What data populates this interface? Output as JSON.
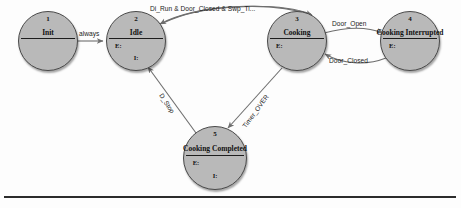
{
  "diagram": {
    "type": "state-transition-diagram",
    "colors": {
      "node_fill": "#b9b9b9",
      "node_stroke": "#4a4a4a",
      "edge_stroke": "#6e6e6e",
      "text": "#111111",
      "rule": "#2c2c2c"
    },
    "states": [
      {
        "index": "1",
        "label": "Init",
        "entry": "",
        "invariant": "",
        "has_entry": false,
        "has_invariant": false,
        "cx": 48,
        "cy": 41,
        "r": 30
      },
      {
        "index": "2",
        "label": "Idle",
        "entry": "E:",
        "invariant": "I:",
        "has_entry": true,
        "has_invariant": true,
        "cx": 136,
        "cy": 41,
        "r": 30
      },
      {
        "index": "3",
        "label": "Cooking",
        "entry": "E:",
        "invariant": "",
        "has_entry": true,
        "has_invariant": false,
        "cx": 297,
        "cy": 41,
        "r": 30
      },
      {
        "index": "4",
        "label": "Cooking Interrupted",
        "entry": "E:",
        "invariant": "",
        "has_entry": true,
        "has_invariant": false,
        "cx": 410,
        "cy": 41,
        "r": 30
      },
      {
        "index": "5",
        "label": "Cooking Completed",
        "entry": "E:",
        "invariant": "I:",
        "has_entry": true,
        "has_invariant": true,
        "cx": 215,
        "cy": 158,
        "r": 32
      }
    ],
    "transitions": [
      {
        "id": "init-to-idle",
        "label": "always",
        "from": "Init",
        "to": "Idle",
        "label_x": 79,
        "label_y": 30,
        "rotate": 0
      },
      {
        "id": "idle-to-cooking",
        "label": "Di_Run & Door_Closed & Swp_Ti...",
        "from": "Idle",
        "to": "Cooking",
        "label_x": 150,
        "label_y": 5,
        "rotate": 0
      },
      {
        "id": "cooking-to-interrupted",
        "label": "Door_Open",
        "from": "Cooking",
        "to": "Cooking Interrupted",
        "label_x": 332,
        "label_y": 20,
        "rotate": 0
      },
      {
        "id": "interrupted-to-cooking",
        "label": "Door_Closed",
        "from": "Cooking Interrupted",
        "to": "Cooking",
        "label_x": 329,
        "label_y": 57,
        "rotate": 0
      },
      {
        "id": "completed-to-idle",
        "label": "D_Stop",
        "from": "Cooking Completed",
        "to": "Idle",
        "label_x": 164,
        "label_y": 92,
        "rotate": 57
      },
      {
        "id": "cooking-to-completed",
        "label": "Timer_OVER",
        "from": "Cooking",
        "to": "Cooking Completed",
        "label_x": 241,
        "label_y": 125,
        "rotate": -54
      }
    ],
    "rule": {
      "y": 196
    }
  }
}
